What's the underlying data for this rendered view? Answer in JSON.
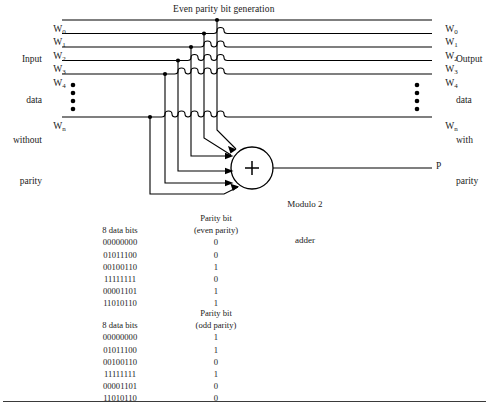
{
  "figure": {
    "title": "Even parity bit generation",
    "left_caption_lines": [
      "Input",
      "data",
      "without",
      "parity"
    ],
    "right_caption_lines": [
      "Output",
      "data",
      "with",
      "parity"
    ],
    "input_labels": [
      "W0",
      "W1",
      "W2",
      "W3",
      "W4",
      "Wn"
    ],
    "output_labels": [
      "W0",
      "W1",
      "W2",
      "W3",
      "W4",
      "Wn"
    ],
    "label_base": "W",
    "label_subs": [
      "0",
      "1",
      "2",
      "3",
      "4",
      "n"
    ],
    "adder_symbol": "+",
    "adder_caption_lines": [
      "Modulo 2",
      "adder"
    ],
    "parity_output_label": "P",
    "vertical_ellipsis_count": 4
  },
  "tables": [
    {
      "header_bits": "8 data bits",
      "header_parity_line1": "Parity bit",
      "header_parity_line2": "(even parity)",
      "rows": [
        {
          "bits": "00000000",
          "parity": "0"
        },
        {
          "bits": "01011100",
          "parity": "0"
        },
        {
          "bits": "00100110",
          "parity": "1"
        },
        {
          "bits": "11111111",
          "parity": "0"
        },
        {
          "bits": "00001101",
          "parity": "1"
        },
        {
          "bits": "11010110",
          "parity": "1"
        }
      ]
    },
    {
      "header_bits": "8 data bits",
      "header_parity_line1": "Parity bit",
      "header_parity_line2": "(odd parity)",
      "rows": [
        {
          "bits": "00000000",
          "parity": "1"
        },
        {
          "bits": "01011100",
          "parity": "1"
        },
        {
          "bits": "00100110",
          "parity": "0"
        },
        {
          "bits": "11111111",
          "parity": "1"
        },
        {
          "bits": "00001101",
          "parity": "0"
        },
        {
          "bits": "11010110",
          "parity": "0"
        }
      ]
    }
  ],
  "colors": {
    "ink": "#1a1a1a",
    "line": "#000000",
    "background": "#ffffff"
  }
}
